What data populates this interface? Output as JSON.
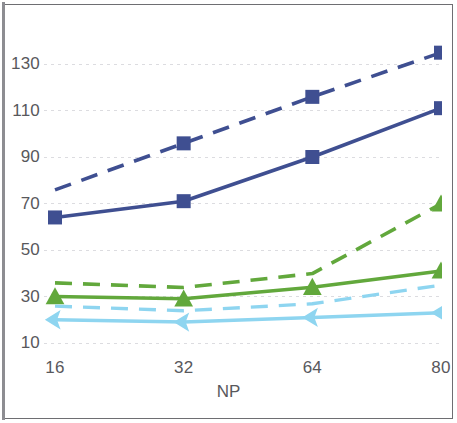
{
  "chart_data": {
    "type": "line",
    "title": "",
    "subtitle": "",
    "xlabel": "NP",
    "ylabel": "",
    "x": [
      16,
      32,
      64,
      80
    ],
    "categories": [
      "16",
      "32",
      "64",
      "80"
    ],
    "x_tick_labels": [
      "16",
      "32",
      "64",
      "80"
    ],
    "y_tick_labels": [
      "10",
      "30",
      "50",
      "70",
      "90",
      "110",
      "130"
    ],
    "y_ticks": [
      10,
      30,
      50,
      70,
      90,
      110,
      130
    ],
    "ylim": [
      3,
      140
    ],
    "xlim_categorical": true,
    "grid": "horizontal-dotted",
    "legend": "none",
    "series": [
      {
        "name": "dark-blue-dashed",
        "color": "#3f4f91",
        "marker": "square",
        "linestyle": "dashed",
        "values": [
          72,
          92,
          112,
          131
        ]
      },
      {
        "name": "dark-blue-solid",
        "color": "#3f4f91",
        "marker": "square",
        "linestyle": "solid",
        "values": [
          64,
          71,
          90,
          111
        ]
      },
      {
        "name": "green-dashed",
        "color": "#62a83c",
        "marker": "triangle",
        "linestyle": "dashed",
        "values": [
          32,
          30,
          36,
          66
        ]
      },
      {
        "name": "green-solid",
        "color": "#62a83c",
        "marker": "triangle",
        "linestyle": "solid",
        "values": [
          30,
          29,
          34,
          41
        ]
      },
      {
        "name": "light-blue-dashed",
        "color": "#8ed5f0",
        "marker": "left-arrow",
        "linestyle": "dashed",
        "values": [
          22,
          20,
          23,
          31
        ]
      },
      {
        "name": "light-blue-solid",
        "color": "#8ed5f0",
        "marker": "left-arrow",
        "linestyle": "solid",
        "values": [
          20,
          19,
          21,
          23
        ]
      }
    ]
  },
  "axes": {
    "x_title": "NP",
    "y_tick_labels": [
      "130",
      "110",
      "90",
      "70",
      "50",
      "30",
      "10"
    ],
    "x_tick_labels": [
      "16",
      "32",
      "64",
      "80"
    ]
  },
  "colors": {
    "dark_blue": "#3f4f91",
    "green": "#62a83c",
    "light_blue": "#8ed5f0",
    "gridline": "#dcdce0",
    "tick_text": "#58585c",
    "frame": "#6e6e72",
    "background": "#ffffff"
  }
}
